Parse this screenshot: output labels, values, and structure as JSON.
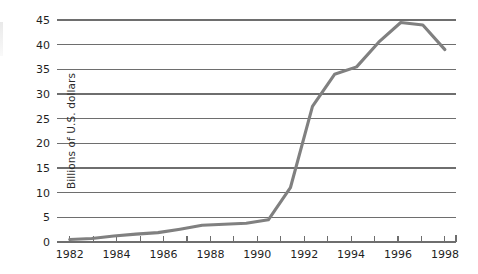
{
  "chart_data": {
    "type": "line",
    "title": "",
    "subtitle": "",
    "xlabel": "",
    "ylabel": "Billions of U.S. dollars",
    "xlim": [
      1982,
      1999
    ],
    "ylim": [
      0,
      45
    ],
    "grid": true,
    "legend": false,
    "legend_position": "none",
    "line_color": "#808080",
    "x": [
      1982,
      1983,
      1984,
      1985,
      1986,
      1987,
      1988,
      1989,
      1990,
      1991,
      1992,
      1993,
      1994,
      1995,
      1996,
      1997,
      1998,
      1999
    ],
    "values": [
      0.5,
      0.7,
      1.2,
      1.6,
      1.9,
      2.6,
      3.4,
      3.6,
      3.8,
      4.5,
      11.0,
      27.5,
      34.0,
      35.5,
      40.5,
      44.5,
      44.0,
      39.0
    ],
    "series": [
      {
        "name": "Billions of U.S. dollars",
        "color": "#808080",
        "values": [
          0.5,
          0.7,
          1.2,
          1.6,
          1.9,
          2.6,
          3.4,
          3.6,
          3.8,
          4.5,
          11.0,
          27.5,
          34.0,
          35.5,
          40.5,
          44.5,
          44.0,
          39.0
        ]
      }
    ],
    "y_ticks": [
      0,
      5,
      10,
      15,
      20,
      25,
      30,
      35,
      40,
      45
    ],
    "y_tick_labels": [
      "0",
      "5",
      "10",
      "15",
      "20",
      "25",
      "30",
      "35",
      "40",
      "45"
    ],
    "x_ticks": [
      1982,
      1983,
      1984,
      1985,
      1986,
      1987,
      1988,
      1989,
      1990,
      1991,
      1992,
      1993,
      1994,
      1995,
      1996,
      1997,
      1998,
      1999
    ],
    "x_tick_labels_major": [
      "1982",
      "1984",
      "1986",
      "1988",
      "1990",
      "1992",
      "1994",
      "1996",
      "1998"
    ],
    "x_major_years": [
      1982,
      1984,
      1986,
      1988,
      1990,
      1992,
      1994,
      1996,
      1998
    ],
    "annotations": []
  },
  "axis": {
    "y_label": "Billions of U.S. dollars"
  },
  "colors": {
    "line": "#808080",
    "grid": "#6e6e6e",
    "axis": "#6e6e6e",
    "text": "#1f1f1f",
    "background": "#ffffff"
  }
}
